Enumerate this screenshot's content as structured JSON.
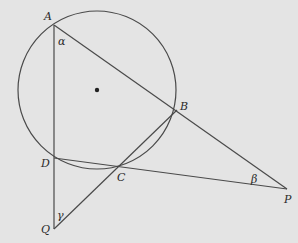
{
  "diagram": {
    "type": "geometry",
    "circle": {
      "cx": 97,
      "cy": 90,
      "r": 79,
      "center_dot": true
    },
    "points": {
      "A": {
        "x": 54,
        "y": 25,
        "label": "A",
        "lx": 44,
        "ly": 20
      },
      "B": {
        "x": 177,
        "y": 110,
        "label": "B",
        "lx": 180,
        "ly": 110
      },
      "C": {
        "x": 121,
        "y": 167,
        "label": "C",
        "lx": 117,
        "ly": 181
      },
      "D": {
        "x": 54,
        "y": 158,
        "label": "D",
        "lx": 41,
        "ly": 167
      },
      "P": {
        "x": 287,
        "y": 189,
        "label": "P",
        "lx": 284,
        "ly": 203
      },
      "Q": {
        "x": 54,
        "y": 229,
        "label": "Q",
        "lx": 41,
        "ly": 233
      }
    },
    "segments": [
      [
        "A",
        "Q"
      ],
      [
        "A",
        "P"
      ],
      [
        "D",
        "P"
      ],
      [
        "Q",
        "B"
      ]
    ],
    "angles": [
      {
        "label": "α",
        "at": "A",
        "x": 58,
        "y": 45
      },
      {
        "label": "β",
        "at": "P",
        "x": 251,
        "y": 183
      },
      {
        "label": "γ",
        "at": "Q",
        "x": 57,
        "y": 219
      }
    ]
  }
}
